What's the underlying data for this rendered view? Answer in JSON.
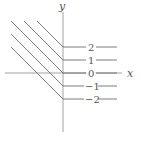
{
  "diagram": {
    "title": "",
    "axes": {
      "x_label": "x",
      "y_label": "y"
    },
    "level_curves": [
      {
        "label": "2",
        "value": 2
      },
      {
        "label": "1",
        "value": 1
      },
      {
        "label": "0",
        "value": 0
      },
      {
        "label": "−1",
        "value": -1
      },
      {
        "label": "−2",
        "value": -2
      }
    ],
    "colors": {
      "line": "#6e6e6e",
      "axis": "#8a8a8a",
      "text": "#555555",
      "background": "#ffffff"
    }
  }
}
